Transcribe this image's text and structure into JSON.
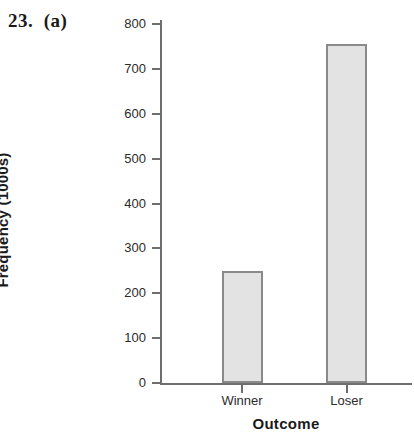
{
  "problem": {
    "label": "23.  (a)"
  },
  "chart_data": {
    "type": "bar",
    "title": "",
    "categories": [
      "Winner",
      "Loser"
    ],
    "values": [
      250,
      755
    ],
    "xlabel": "Outcome",
    "ylabel": "Frequency (1000s)",
    "ylim": [
      0,
      800
    ],
    "ytick_labels": [
      "0",
      "100",
      "200",
      "300",
      "400",
      "500",
      "600",
      "700",
      "800"
    ],
    "ytick_values": [
      0,
      100,
      200,
      300,
      400,
      500,
      600,
      700,
      800
    ],
    "grid": false,
    "legend": false,
    "bar_fill_color": "#e3e3e3",
    "bar_border_color": "#8a8a8a",
    "axis_color": "#6e6e6e",
    "background_color": "#ffffff"
  }
}
